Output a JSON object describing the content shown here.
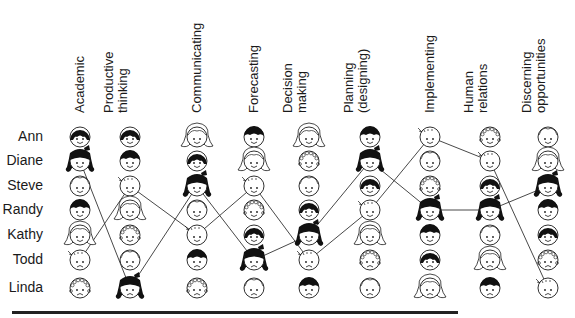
{
  "columns": [
    {
      "label_lines": [
        "Academic"
      ],
      "x": 80
    },
    {
      "label_lines": [
        "Productive",
        "thinking"
      ],
      "x": 130
    },
    {
      "label_lines": [
        "Communicating"
      ],
      "x": 197
    },
    {
      "label_lines": [
        "Forecasting"
      ],
      "x": 254
    },
    {
      "label_lines": [
        "Decision",
        "making"
      ],
      "x": 309
    },
    {
      "label_lines": [
        "Planning",
        "(designing)"
      ],
      "x": 370
    },
    {
      "label_lines": [
        "Implementing"
      ],
      "x": 430
    },
    {
      "label_lines": [
        "Human",
        "relations"
      ],
      "x": 490
    },
    {
      "label_lines": [
        "Discerning",
        "opportunities"
      ],
      "x": 548
    }
  ],
  "rows": [
    {
      "label": "Ann",
      "y": 137
    },
    {
      "label": "Diane",
      "y": 161
    },
    {
      "label": "Steve",
      "y": 186
    },
    {
      "label": "Randy",
      "y": 210
    },
    {
      "label": "Kathy",
      "y": 235
    },
    {
      "label": "Todd",
      "y": 260
    },
    {
      "label": "Linda",
      "y": 288
    }
  ],
  "face_types": {
    "A": {
      "name": "dark-bob-face",
      "desc": "dark hair with bangs"
    },
    "B": {
      "name": "dark-bow-face",
      "desc": "dark flipped hair with bow"
    },
    "C": {
      "name": "light-boy-face",
      "desc": "light short hair"
    },
    "D": {
      "name": "dark-boy-face",
      "desc": "dark short hair"
    },
    "E": {
      "name": "light-long-hair-face",
      "desc": "light long hair"
    },
    "F": {
      "name": "light-cowlick-face",
      "desc": "light hair with cowlick"
    },
    "G": {
      "name": "curly-face",
      "desc": "light curly hair"
    }
  },
  "rankings": [
    [
      "A",
      "B",
      "C",
      "D",
      "E",
      "F",
      "G"
    ],
    [
      "A",
      "D",
      "F",
      "E",
      "G",
      "C",
      "B"
    ],
    [
      "E",
      "A",
      "B",
      "C",
      "F",
      "D",
      "G"
    ],
    [
      "D",
      "E",
      "F",
      "G",
      "A",
      "B",
      "C"
    ],
    [
      "E",
      "G",
      "C",
      "A",
      "B",
      "F",
      "D"
    ],
    [
      "D",
      "B",
      "A",
      "F",
      "E",
      "G",
      "C"
    ],
    [
      "F",
      "C",
      "G",
      "B",
      "D",
      "A",
      "E"
    ],
    [
      "G",
      "F",
      "A",
      "B",
      "C",
      "E",
      "D"
    ],
    [
      "C",
      "E",
      "B",
      "D",
      "A",
      "G",
      "F"
    ]
  ],
  "traced_faces": [
    "B",
    "F"
  ],
  "colors": {
    "ink": "#1a1a1a",
    "dark_hair": "#111111",
    "face_fill": "#ffffff",
    "line": "#333333"
  }
}
